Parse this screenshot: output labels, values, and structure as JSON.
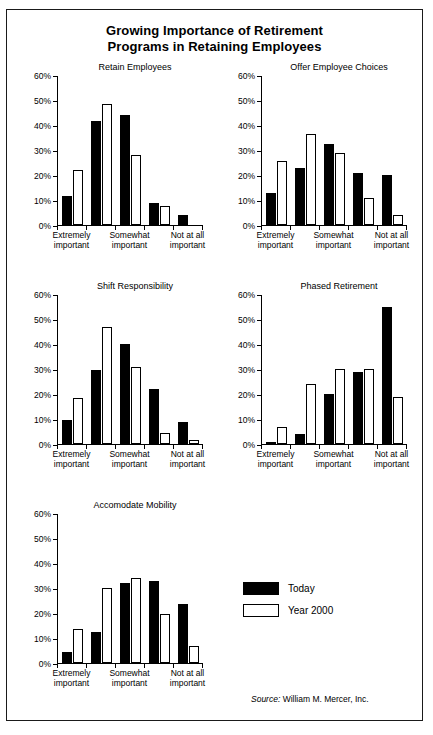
{
  "figure": {
    "title_line1": "Growing Importance of Retirement",
    "title_line2": "Programs in Retaining Employees",
    "source_keyword": "Source:",
    "source_text": " William M. Mercer, Inc."
  },
  "legend": {
    "position": "bottom-right",
    "items": [
      {
        "label": "Today",
        "color": "#000000",
        "style": "filled"
      },
      {
        "label": "Year 2000",
        "color": "#ffffff",
        "style": "outlined"
      }
    ]
  },
  "axis": {
    "y_ticks": [
      "0%",
      "10%",
      "20%",
      "30%",
      "40%",
      "50%",
      "60%"
    ],
    "x_labels": [
      {
        "line1": "Extremely",
        "line2": "important"
      },
      {
        "line1": "Somewhat",
        "line2": "important"
      },
      {
        "line1": "Not at all",
        "line2": "important"
      }
    ]
  },
  "chart_data": [
    {
      "type": "bar",
      "title": "Retain Employees",
      "categories": [
        "Extremely important",
        "2",
        "Somewhat important",
        "4",
        "Not at all important"
      ],
      "xlabel": "",
      "ylabel": "",
      "ylim": [
        0,
        60
      ],
      "yticks": [
        0,
        10,
        20,
        30,
        40,
        50,
        60
      ],
      "grid": false,
      "series": [
        {
          "name": "Today",
          "values": [
            11.5,
            41.5,
            44,
            9,
            4
          ]
        },
        {
          "name": "Year 2000",
          "values": [
            22,
            48.5,
            28,
            7.5,
            0
          ]
        }
      ]
    },
    {
      "type": "bar",
      "title": "Offer Employee Choices",
      "categories": [
        "Extremely important",
        "2",
        "Somewhat important",
        "4",
        "Not at all important"
      ],
      "xlabel": "",
      "ylabel": "",
      "ylim": [
        0,
        60
      ],
      "yticks": [
        0,
        10,
        20,
        30,
        40,
        50,
        60
      ],
      "grid": false,
      "series": [
        {
          "name": "Today",
          "values": [
            13,
            23,
            32.5,
            21,
            20
          ]
        },
        {
          "name": "Year 2000",
          "values": [
            25.5,
            36.5,
            29,
            11,
            4
          ]
        }
      ]
    },
    {
      "type": "bar",
      "title": "Shift Responsibility",
      "categories": [
        "Extremely important",
        "2",
        "Somewhat important",
        "4",
        "Not at all important"
      ],
      "xlabel": "",
      "ylabel": "",
      "ylim": [
        0,
        60
      ],
      "yticks": [
        0,
        10,
        20,
        30,
        40,
        50,
        60
      ],
      "grid": false,
      "series": [
        {
          "name": "Today",
          "values": [
            9.5,
            29.5,
            40,
            22,
            9
          ]
        },
        {
          "name": "Year 2000",
          "values": [
            18.5,
            47,
            31,
            4.5,
            1.5
          ]
        }
      ]
    },
    {
      "type": "bar",
      "title": "Phased Retirement",
      "categories": [
        "Extremely important",
        "2",
        "Somewhat important",
        "4",
        "Not at all important"
      ],
      "xlabel": "",
      "ylabel": "",
      "ylim": [
        0,
        60
      ],
      "yticks": [
        0,
        10,
        20,
        30,
        40,
        50,
        60
      ],
      "grid": false,
      "series": [
        {
          "name": "Today",
          "values": [
            1,
            4,
            20,
            29,
            55
          ]
        },
        {
          "name": "Year 2000",
          "values": [
            7,
            24,
            30,
            30,
            19
          ]
        }
      ]
    },
    {
      "type": "bar",
      "title": "Accomodate Mobility",
      "categories": [
        "Extremely important",
        "2",
        "Somewhat important",
        "4",
        "Not at all important"
      ],
      "xlabel": "",
      "ylabel": "",
      "ylim": [
        0,
        60
      ],
      "yticks": [
        0,
        10,
        20,
        30,
        40,
        50,
        60
      ],
      "grid": false,
      "series": [
        {
          "name": "Today",
          "values": [
            4.5,
            12.5,
            32,
            33,
            23.5
          ]
        },
        {
          "name": "Year 2000",
          "values": [
            13.5,
            30,
            34,
            19.5,
            7
          ]
        }
      ]
    }
  ]
}
